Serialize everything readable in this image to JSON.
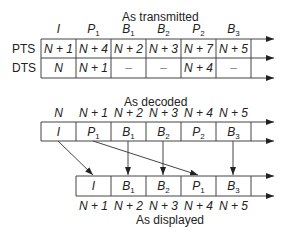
{
  "transmitted": {
    "title": "As transmitted",
    "frames": [
      {
        "type": "I",
        "sub": ""
      },
      {
        "type": "P",
        "sub": "1"
      },
      {
        "type": "B",
        "sub": "1"
      },
      {
        "type": "B",
        "sub": "2"
      },
      {
        "type": "P",
        "sub": "2"
      },
      {
        "type": "B",
        "sub": "3"
      }
    ],
    "rows": [
      {
        "label": "PTS",
        "values": [
          "N + 1",
          "N + 4",
          "N + 2",
          "N + 3",
          "N + 7",
          "N + 5"
        ]
      },
      {
        "label": "DTS",
        "values": [
          "N",
          "N + 1",
          "–",
          "–",
          "N + 4",
          "–"
        ]
      }
    ]
  },
  "decoded": {
    "title": "As decoded",
    "times": [
      "N",
      "N + 1",
      "N + 2",
      "N + 3",
      "N + 4",
      "N + 5"
    ],
    "frames": [
      {
        "type": "I",
        "sub": ""
      },
      {
        "type": "P",
        "sub": "1"
      },
      {
        "type": "B",
        "sub": "1"
      },
      {
        "type": "B",
        "sub": "2"
      },
      {
        "type": "P",
        "sub": "2"
      },
      {
        "type": "B",
        "sub": "3"
      }
    ]
  },
  "displayed": {
    "title": "As displayed",
    "times": [
      "N + 1",
      "N + 2",
      "N + 3",
      "N + 4",
      "N + 5"
    ],
    "frames": [
      {
        "type": "I",
        "sub": ""
      },
      {
        "type": "B",
        "sub": "1"
      },
      {
        "type": "B",
        "sub": "2"
      },
      {
        "type": "P",
        "sub": "1"
      },
      {
        "type": "B",
        "sub": "3"
      }
    ]
  }
}
